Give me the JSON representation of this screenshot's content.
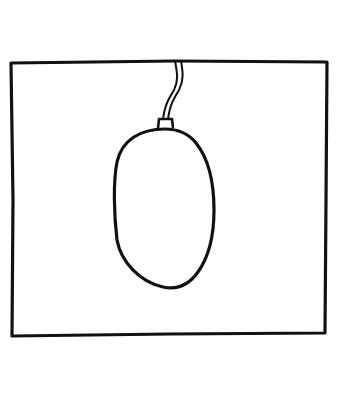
{
  "illustration": {
    "subject": "hanging-oval-object",
    "description": "Hand-drawn line art of an egg-shaped object hanging from a cord inside a rectangular frame",
    "colors": {
      "background": "#ffffff",
      "stroke": "#111111"
    }
  }
}
